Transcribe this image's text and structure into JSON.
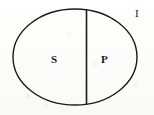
{
  "figure": {
    "kind": "venn-style-set-diagram",
    "background_color": "#fdfdfd",
    "stroke_color": "#1a1a1a"
  },
  "shapes": {
    "outer_ellipse": {
      "name": "universal-set-ellipse",
      "cx": 75,
      "cy": 57,
      "rx": 62,
      "ry": 48,
      "stroke_width": 1.4,
      "fill": "none"
    },
    "divider_line": {
      "name": "vertical-chord-divider",
      "x1": 86.5,
      "y1": 9.5,
      "x2": 86.5,
      "y2": 104.5,
      "stroke_width": 1.6
    }
  },
  "labels": {
    "left_region": "S",
    "right_region": "P",
    "outside_region": "I"
  }
}
